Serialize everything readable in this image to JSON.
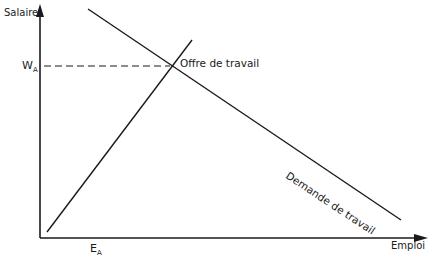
{
  "diagram": {
    "type": "supply-demand",
    "axes": {
      "y_label": "Salaire",
      "x_label": "Emploi"
    },
    "equilibrium": {
      "wage_label_main": "W",
      "wage_label_sub": "A",
      "employment_label_main": "E",
      "employment_label_sub": "A"
    },
    "curves": {
      "supply_label": "Offre de travail",
      "demand_label": "Demande de travail"
    },
    "colors": {
      "line": "#1a1a1a",
      "background": "#ffffff"
    }
  }
}
